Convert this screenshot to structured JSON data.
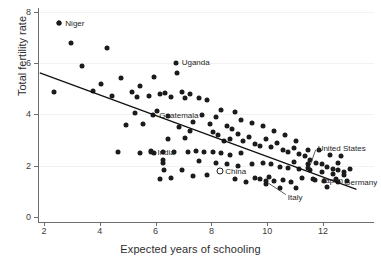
{
  "chart_data": {
    "type": "scatter",
    "title": "",
    "xlabel": "Expected years of schooling",
    "ylabel": "Total fertility rate",
    "xlim": [
      1.6,
      13.5
    ],
    "ylim": [
      0,
      8.4
    ],
    "xticks": [
      2,
      4,
      6,
      8,
      10,
      12
    ],
    "xticklabels": [
      "2",
      "4",
      "6",
      "8",
      "10",
      "12"
    ],
    "yticks": [
      0,
      2,
      4,
      6,
      8
    ],
    "yticklabels": [
      "0",
      "2",
      "4",
      "6",
      "8"
    ],
    "grid": "horizontal-light",
    "legend": "none",
    "trendline": {
      "x": [
        1.85,
        13.2
      ],
      "y": [
        5.62,
        1.08
      ],
      "color": "#111111"
    },
    "points": [
      [
        2.55,
        7.55
      ],
      [
        2.35,
        4.88
      ],
      [
        2.95,
        6.78
      ],
      [
        3.35,
        5.87
      ],
      [
        4.25,
        6.57
      ],
      [
        4.05,
        5.18
      ],
      [
        3.75,
        4.92
      ],
      [
        4.75,
        5.42
      ],
      [
        4.45,
        4.72
      ],
      [
        5.15,
        4.86
      ],
      [
        5.45,
        5.12
      ],
      [
        5.35,
        4.68
      ],
      [
        5.95,
        5.46
      ],
      [
        5.75,
        4.72
      ],
      [
        6.15,
        4.78
      ],
      [
        6.35,
        4.82
      ],
      [
        6.55,
        4.66
      ],
      [
        6.75,
        5.62
      ],
      [
        6.95,
        4.88
      ],
      [
        7.05,
        4.62
      ],
      [
        7.25,
        4.8
      ],
      [
        6.05,
        4.12
      ],
      [
        5.25,
        4.05
      ],
      [
        4.95,
        3.58
      ],
      [
        5.55,
        3.62
      ],
      [
        6.45,
        3.92
      ],
      [
        6.85,
        3.52
      ],
      [
        7.35,
        3.72
      ],
      [
        7.55,
        4.62
      ],
      [
        7.85,
        4.56
      ],
      [
        7.65,
        3.98
      ],
      [
        7.95,
        3.62
      ],
      [
        8.15,
        3.9
      ],
      [
        8.35,
        4.18
      ],
      [
        8.55,
        3.55
      ],
      [
        8.05,
        3.32
      ],
      [
        8.25,
        3.18
      ],
      [
        8.45,
        2.98
      ],
      [
        8.65,
        3.05
      ],
      [
        8.75,
        3.42
      ],
      [
        8.95,
        3.22
      ],
      [
        9.15,
        2.95
      ],
      [
        9.35,
        3.12
      ],
      [
        9.55,
        2.86
      ],
      [
        9.75,
        2.78
      ],
      [
        9.95,
        3.05
      ],
      [
        10.15,
        2.72
      ],
      [
        10.35,
        2.88
      ],
      [
        10.55,
        2.62
      ],
      [
        10.75,
        2.52
      ],
      [
        10.95,
        2.7
      ],
      [
        11.15,
        2.45
      ],
      [
        11.35,
        2.38
      ],
      [
        11.55,
        2.22
      ],
      [
        11.75,
        2.12
      ],
      [
        11.95,
        2.08
      ],
      [
        12.15,
        1.95
      ],
      [
        12.35,
        1.88
      ],
      [
        12.55,
        1.82
      ],
      [
        12.75,
        1.75
      ],
      [
        12.95,
        1.88
      ],
      [
        12.65,
        2.38
      ],
      [
        12.25,
        2.42
      ],
      [
        11.85,
        2.62
      ],
      [
        11.45,
        2.62
      ],
      [
        11.05,
        2.98
      ],
      [
        10.65,
        3.18
      ],
      [
        10.25,
        3.35
      ],
      [
        9.85,
        3.55
      ],
      [
        9.45,
        3.68
      ],
      [
        9.05,
        3.78
      ],
      [
        8.85,
        4.08
      ],
      [
        7.45,
        2.58
      ],
      [
        7.15,
        2.55
      ],
      [
        6.65,
        2.52
      ],
      [
        6.25,
        2.52
      ],
      [
        7.75,
        2.55
      ],
      [
        8.05,
        2.55
      ],
      [
        8.35,
        2.48
      ],
      [
        8.65,
        2.42
      ],
      [
        6.25,
        2.1
      ],
      [
        6.28,
        2.22
      ],
      [
        6.3,
        1.85
      ],
      [
        6.95,
        1.85
      ],
      [
        7.35,
        1.58
      ],
      [
        7.85,
        1.62
      ],
      [
        8.85,
        1.48
      ],
      [
        9.25,
        1.38
      ],
      [
        9.55,
        1.52
      ],
      [
        9.75,
        1.48
      ],
      [
        10.05,
        1.55
      ],
      [
        10.25,
        1.42
      ],
      [
        9.95,
        1.28
      ],
      [
        10.55,
        1.45
      ],
      [
        10.85,
        1.38
      ],
      [
        11.25,
        1.52
      ],
      [
        11.65,
        1.48
      ],
      [
        12.05,
        1.42
      ],
      [
        12.45,
        1.5
      ],
      [
        12.85,
        1.42
      ],
      [
        12.15,
        1.18
      ],
      [
        11.05,
        1.15
      ],
      [
        10.45,
        1.12
      ],
      [
        9.45,
        2.05
      ],
      [
        9.85,
        2.12
      ],
      [
        10.15,
        2.05
      ],
      [
        10.45,
        1.95
      ],
      [
        10.75,
        1.92
      ],
      [
        11.15,
        1.88
      ],
      [
        11.55,
        1.82
      ],
      [
        11.95,
        1.75
      ],
      [
        12.35,
        1.68
      ],
      [
        12.75,
        1.62
      ],
      [
        8.15,
        2.12
      ],
      [
        7.55,
        2.18
      ],
      [
        5.85,
        2.58
      ],
      [
        4.65,
        2.52
      ],
      [
        5.45,
        2.48
      ],
      [
        5.95,
        2.5
      ],
      [
        6.45,
        3.05
      ],
      [
        7.05,
        3.08
      ],
      [
        7.25,
        3.35
      ],
      [
        8.55,
        2.05
      ],
      [
        8.95,
        1.98
      ],
      [
        9.05,
        2.48
      ],
      [
        10.95,
        2.15
      ],
      [
        11.45,
        2.05
      ],
      [
        12.55,
        2.12
      ],
      [
        6.55,
        1.52
      ],
      [
        6.15,
        1.48
      ]
    ],
    "labeled_points": [
      {
        "name": "Niger",
        "x": 2.55,
        "y": 7.55,
        "label_dx": 6,
        "label_dy": 0,
        "leader": false,
        "marker": "filled"
      },
      {
        "name": "Uganda",
        "x": 6.72,
        "y": 6.02,
        "label_dx": 6,
        "label_dy": -1,
        "leader": false,
        "marker": "filled"
      },
      {
        "name": "Guatemala",
        "x": 5.92,
        "y": 3.98,
        "label_dx": 6,
        "label_dy": 0,
        "leader": false,
        "marker": "filled"
      },
      {
        "name": "India",
        "x": 5.85,
        "y": 2.55,
        "label_dx": 6,
        "label_dy": 0,
        "leader": false,
        "marker": "filled"
      },
      {
        "name": "China",
        "x": 8.32,
        "y": 1.78,
        "label_dx": 5,
        "label_dy": 0,
        "leader": false,
        "marker": "hollow"
      },
      {
        "name": "Italy",
        "x": 9.95,
        "y": 1.42,
        "label_dx": 22,
        "label_dy": 16,
        "leader": true,
        "marker": "filled"
      },
      {
        "name": "United States",
        "x": 11.45,
        "y": 1.92,
        "label_dx": 10,
        "label_dy": -20,
        "leader": true,
        "marker": "filled"
      },
      {
        "name": "Japan",
        "x": 11.72,
        "y": 1.45,
        "label_dx": 6,
        "label_dy": 0,
        "leader": false,
        "marker": "filled"
      },
      {
        "name": "Germany",
        "x": 12.55,
        "y": 1.35,
        "label_dx": 6,
        "label_dy": 0,
        "leader": false,
        "marker": "filled"
      }
    ]
  },
  "axis": {
    "x_title": "Expected years of schooling",
    "y_title": "Total fertility rate"
  }
}
